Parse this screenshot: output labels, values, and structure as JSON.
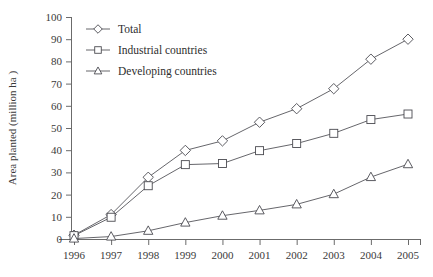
{
  "chart_data": {
    "type": "line",
    "title": "",
    "xlabel": "",
    "ylabel": "Area planted (million ha )",
    "x": [
      1996,
      1997,
      1998,
      1999,
      2000,
      2001,
      2002,
      2003,
      2004,
      2005
    ],
    "xtick_labels": [
      "1996",
      "1997",
      "1998",
      "1999",
      "2000",
      "2001",
      "2002",
      "2003",
      "2004",
      "2005"
    ],
    "ytick_labels": [
      "0",
      "10",
      "20",
      "30",
      "40",
      "50",
      "60",
      "70",
      "80",
      "90",
      "100"
    ],
    "yticks": [
      0,
      10,
      20,
      30,
      40,
      50,
      60,
      70,
      80,
      90,
      100
    ],
    "ylim": [
      0,
      100
    ],
    "xlim": [
      1996,
      2005
    ],
    "grid": false,
    "legend_position": "top-left",
    "series": [
      {
        "name": "Total",
        "marker": "diamond",
        "color": "#55555a",
        "values": [
          1.7,
          11.0,
          27.8,
          39.9,
          44.2,
          52.6,
          58.7,
          67.7,
          81.0,
          90.0
        ]
      },
      {
        "name": "Industrial countries",
        "marker": "square",
        "color": "#55555a",
        "values": [
          1.5,
          9.8,
          24.0,
          33.5,
          34.0,
          39.8,
          43.0,
          47.6,
          53.8,
          56.3
        ]
      },
      {
        "name": "Developing countries",
        "marker": "triangle",
        "color": "#55555a",
        "values": [
          0.2,
          1.1,
          3.7,
          7.4,
          10.5,
          12.9,
          15.6,
          20.2,
          27.9,
          33.7
        ]
      }
    ]
  },
  "legend": {
    "entries": [
      {
        "label": "Total"
      },
      {
        "label": "Industrial countries"
      },
      {
        "label": "Developing countries"
      }
    ]
  },
  "axes": {
    "y_title": "Area planted (million ha )"
  }
}
